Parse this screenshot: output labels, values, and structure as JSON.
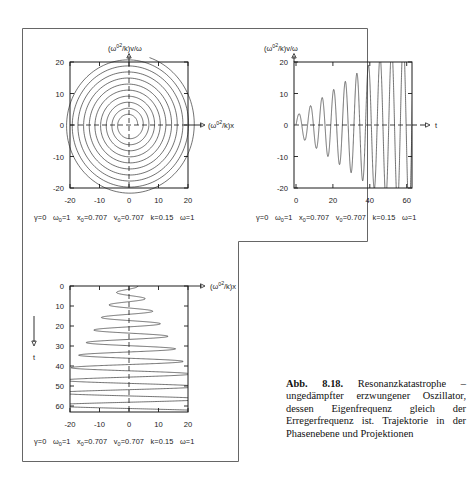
{
  "figure": {
    "caption_label": "Abb. 8.18.",
    "caption_text": "Resonanzkatastrophe – ungedämpfter erzwungener Oszillator, dessen Eigenfrequenz gleich der Erregerfrequenz ist. Trajektorie in der Phasenebene und Projektionen",
    "frame_color": "#555555",
    "line_color": "#1a1a1a",
    "background": "#ffffff"
  },
  "parameters": {
    "gamma": "γ=0",
    "omega0": "ω₀=1",
    "x0": "x₀=0.707",
    "v0": "v₀=0.707",
    "k": "k=0.15",
    "omega": "ω=1",
    "line": "γ=0   ω₀=1   x₀=0.707   v₀=0.707   k=0.15   ω=1"
  },
  "chart_data": [
    {
      "id": "phase-plane",
      "type": "line",
      "title": "",
      "xlabel": "(ω₀²/k)x",
      "ylabel": "(ω₀²/k)v/ω",
      "xlim": [
        -24,
        24
      ],
      "ylim": [
        -24,
        24
      ],
      "xticks": [
        -20,
        -10,
        0,
        10,
        20
      ],
      "yticks": [
        -20,
        -10,
        0,
        10,
        20
      ],
      "xtick_labels": [
        "-20",
        "-10",
        "0",
        "10",
        "20"
      ],
      "ytick_labels": [
        "-20",
        "-10",
        "0",
        "10",
        "20"
      ],
      "grid": "dashed-center-crosshairs",
      "description": "Outward growing spiral of an undamped driven resonant oscillator; radius grows linearly with time from ~3 to ~22",
      "spiral": {
        "r_start": 2.9,
        "r_end": 22.5,
        "turns": 10.2,
        "points": 1400,
        "phase0": 0.0
      }
    },
    {
      "id": "v-vs-t",
      "type": "line",
      "title": "",
      "xlabel": "t",
      "ylabel": "(ω₀²/k)v/ω",
      "xlim": [
        -1.5,
        66
      ],
      "ylim": [
        -21.5,
        21.5
      ],
      "xticks": [
        0,
        20,
        40,
        60
      ],
      "yticks": [
        -20,
        -10,
        0,
        10,
        20
      ],
      "xtick_labels": [
        "0",
        "20",
        "40",
        "60"
      ],
      "ytick_labels": [
        "-20",
        "-10",
        "0",
        "10",
        "20"
      ],
      "grid": "dashed-zero-line",
      "description": "Velocity versus time: sinusoid whose amplitude grows linearly with t, clipped by the box beyond t≈48",
      "wave": {
        "t_start": 0,
        "t_end": 64,
        "period": 6.283,
        "amp_slope": 0.41,
        "amp0": 2.9,
        "clip": 20,
        "phase0": 0.0
      }
    },
    {
      "id": "x-vs-t",
      "type": "line",
      "title": "",
      "xlabel": "(ω₀²/k)x",
      "ylabel": "t",
      "xlim": [
        -24,
        24
      ],
      "ylim": [
        0,
        64
      ],
      "xticks": [
        -20,
        -10,
        0,
        10,
        20
      ],
      "yticks": [
        0,
        10,
        20,
        30,
        40,
        50,
        60
      ],
      "xtick_labels": [
        "-20",
        "-10",
        "0",
        "10",
        "20"
      ],
      "ytick_labels": [
        "0",
        "10",
        "20",
        "30",
        "40",
        "50",
        "60"
      ],
      "grid": "dashed-zero-line",
      "y_direction": "downward",
      "description": "Displacement versus time plotted with t increasing downward; amplitude grows linearly and is clipped at ±21 beyond t≈50",
      "wave": {
        "t_start": 0,
        "t_end": 63,
        "period": 6.283,
        "amp_slope": 0.41,
        "amp0": 2.9,
        "clip": 21,
        "phase0": 1.5708
      }
    }
  ]
}
